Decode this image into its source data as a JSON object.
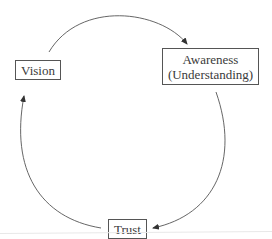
{
  "diagram": {
    "type": "cycle",
    "nodes": [
      {
        "id": "vision",
        "label": "Vision"
      },
      {
        "id": "awareness",
        "label_line1": "Awareness",
        "label_line2": "(Understanding)"
      },
      {
        "id": "trust",
        "label": "Trust"
      }
    ],
    "edges": [
      {
        "from": "vision",
        "to": "awareness"
      },
      {
        "from": "awareness",
        "to": "trust"
      },
      {
        "from": "trust",
        "to": "vision"
      }
    ],
    "colors": {
      "line": "#555555",
      "text": "#3a3a3a",
      "background": "#ffffff"
    }
  }
}
